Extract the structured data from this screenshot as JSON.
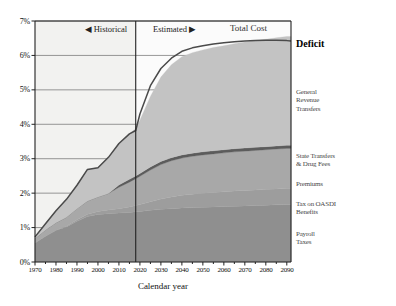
{
  "chart_data": {
    "type": "area",
    "title": "",
    "xlabel": "Calendar year",
    "ylabel": "",
    "xlim": [
      1970,
      2092
    ],
    "ylim": [
      0,
      7
    ],
    "grid": true,
    "legend_position": "right",
    "x_ticks": [
      1970,
      1980,
      1990,
      2000,
      2010,
      2020,
      2030,
      2040,
      2050,
      2060,
      2070,
      2080,
      2090
    ],
    "y_ticks": [
      "0%",
      "1%",
      "2%",
      "3%",
      "4%",
      "5%",
      "6%",
      "7%"
    ],
    "divider_year": 2018,
    "era_left_label": "◀ Historical",
    "era_right_label": "Estimated ▶",
    "line_label": "Total Cost",
    "x": [
      1970,
      1975,
      1980,
      1985,
      1990,
      1995,
      2000,
      2005,
      2010,
      2015,
      2018,
      2020,
      2025,
      2030,
      2035,
      2040,
      2045,
      2050,
      2055,
      2060,
      2065,
      2070,
      2075,
      2080,
      2085,
      2090,
      2092
    ],
    "series": [
      {
        "name": "Payroll Taxes",
        "color": "#8f8f8f",
        "values": [
          0.55,
          0.75,
          0.92,
          1.02,
          1.18,
          1.32,
          1.38,
          1.4,
          1.42,
          1.44,
          1.46,
          1.47,
          1.5,
          1.53,
          1.55,
          1.57,
          1.58,
          1.59,
          1.6,
          1.61,
          1.62,
          1.63,
          1.64,
          1.65,
          1.66,
          1.67,
          1.67
        ]
      },
      {
        "name": "Tax on OASDI Benefits",
        "color": "#9d9d9d",
        "values": [
          0.0,
          0.0,
          0.0,
          0.02,
          0.05,
          0.07,
          0.09,
          0.11,
          0.13,
          0.16,
          0.18,
          0.2,
          0.25,
          0.3,
          0.34,
          0.37,
          0.39,
          0.41,
          0.42,
          0.43,
          0.44,
          0.45,
          0.45,
          0.46,
          0.46,
          0.47,
          0.47
        ]
      },
      {
        "name": "Premiums",
        "color": "#a8a8a8",
        "values": [
          0.13,
          0.18,
          0.22,
          0.26,
          0.32,
          0.38,
          0.42,
          0.48,
          0.62,
          0.72,
          0.78,
          0.82,
          0.92,
          1.0,
          1.05,
          1.08,
          1.1,
          1.11,
          1.12,
          1.13,
          1.14,
          1.14,
          1.15,
          1.15,
          1.16,
          1.16,
          1.16
        ]
      },
      {
        "name": "State Transfers & Drug Fees",
        "color": "#5c5c5c",
        "values": [
          0.0,
          0.0,
          0.0,
          0.0,
          0.0,
          0.0,
          0.0,
          0.0,
          0.07,
          0.08,
          0.08,
          0.08,
          0.09,
          0.09,
          0.09,
          0.09,
          0.09,
          0.09,
          0.09,
          0.09,
          0.09,
          0.09,
          0.09,
          0.09,
          0.09,
          0.09,
          0.09
        ]
      },
      {
        "name": "General Revenue Transfers",
        "color": "#c3c3c3",
        "values": [
          0.05,
          0.18,
          0.35,
          0.52,
          0.68,
          0.92,
          0.85,
          1.05,
          1.2,
          1.32,
          1.38,
          1.55,
          2.05,
          2.45,
          2.7,
          2.85,
          2.92,
          2.96,
          3.0,
          3.02,
          3.05,
          3.08,
          3.1,
          3.12,
          3.14,
          3.16,
          3.16
        ]
      }
    ],
    "total_cost_line": {
      "name": "Total Cost",
      "color": "#4a4a4a",
      "values": [
        0.73,
        1.11,
        1.49,
        1.82,
        2.23,
        2.69,
        2.74,
        3.04,
        3.44,
        3.72,
        3.82,
        4.3,
        5.12,
        5.62,
        5.92,
        6.12,
        6.22,
        6.28,
        6.33,
        6.37,
        6.4,
        6.42,
        6.43,
        6.44,
        6.44,
        6.43,
        6.42
      ]
    },
    "deficit_label": "Deficit"
  },
  "right_labels": [
    {
      "key": "deficit",
      "text": "Deficit"
    },
    {
      "key": "general-revenue-transfers",
      "line1": "General",
      "line2": "Revenue",
      "line3": "Transfers"
    },
    {
      "key": "state-transfers-drug-fees",
      "line1": "State Transfers",
      "line2": "& Drug Fees"
    },
    {
      "key": "premiums",
      "line1": "Premiums",
      "line2": ""
    },
    {
      "key": "tax-on-oasdi-benefits",
      "line1": "Tax on OASDI",
      "line2": "Benefits"
    },
    {
      "key": "payroll-taxes",
      "line1": "Payroll",
      "line2": "Taxes"
    }
  ],
  "labels": {
    "y0": "0%",
    "y1": "1%",
    "y2": "2%",
    "y3": "3%",
    "y4": "4%",
    "y5": "5%",
    "y6": "6%",
    "y7": "7%",
    "x1970": "1970",
    "x1980": "1980",
    "x1990": "1990",
    "x2000": "2000",
    "x2010": "2010",
    "x2020": "2020",
    "x2030": "2030",
    "x2040": "2040",
    "x2050": "2050",
    "x2060": "2060",
    "x2070": "2070",
    "x2080": "2080",
    "x2090": "2090",
    "axis_title": "Calendar year",
    "era_historical": "◀ Historical",
    "era_estimated": "Estimated ▶",
    "total_cost": "Total Cost",
    "gen_rev_1": "General",
    "gen_rev_2": "Revenue",
    "gen_rev_3": "Transfers",
    "state_1": "State Transfers",
    "state_2": "& Drug Fees",
    "premiums": "Premiums",
    "oasdi_1": "Tax on OASDI",
    "oasdi_2": "Benefits",
    "payroll_1": "Payroll",
    "payroll_2": "Taxes",
    "deficit": "Deficit"
  }
}
